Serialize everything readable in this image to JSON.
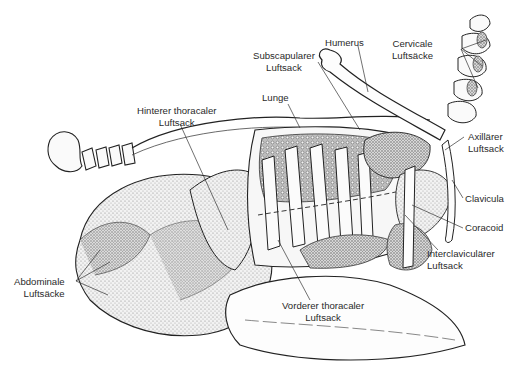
{
  "figure": {
    "accent_colors": {
      "line": "#222222",
      "stipple": "#8a8a8a",
      "fill_light": "#e8e8e8",
      "lung_pattern": "#666666"
    }
  },
  "labels": {
    "humerus": {
      "line1": "Humerus"
    },
    "cervicale": {
      "line1": "Cervicale",
      "line2": "Luftsäcke"
    },
    "subscapularer": {
      "line1": "Subscapularer",
      "line2": "Luftsack"
    },
    "lunge": {
      "line1": "Lunge"
    },
    "hinterer": {
      "line1": "Hinterer thoracaler",
      "line2": "Luftsack"
    },
    "axillaerer": {
      "line1": "Axillärer",
      "line2": "Luftsack"
    },
    "clavicula": {
      "line1": "Clavicula"
    },
    "coracoid": {
      "line1": "Coracoid"
    },
    "interclavicularer": {
      "line1": "Interclaviculärer",
      "line2": "Luftsack"
    },
    "abdominale": {
      "line1": "Abdominale",
      "line2": "Luftsäcke"
    },
    "vorderer": {
      "line1": "Vorderer thoracaler",
      "line2": "Luftsack"
    }
  }
}
